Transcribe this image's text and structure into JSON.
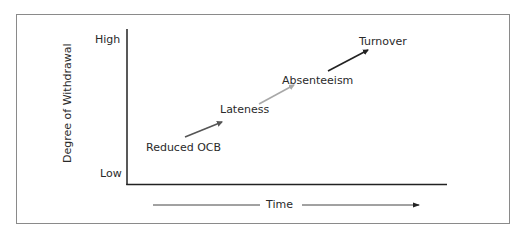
{
  "diagram": {
    "type": "progression-model",
    "y_axis": {
      "label": "Degree of Withdrawal",
      "high_label": "High",
      "low_label": "Low"
    },
    "x_axis": {
      "label": "Time"
    },
    "stages": [
      {
        "label": "Reduced OCB"
      },
      {
        "label": "Lateness"
      },
      {
        "label": "Absenteeism"
      },
      {
        "label": "Turnover"
      }
    ],
    "arrows": [
      {
        "from": "Reduced OCB",
        "to": "Lateness",
        "color": "#555555"
      },
      {
        "from": "Lateness",
        "to": "Absenteeism",
        "color": "#a8a8a8"
      },
      {
        "from": "Absenteeism",
        "to": "Turnover",
        "color": "#222222"
      }
    ],
    "colors": {
      "frame": "#8a8a8a",
      "axis": "#222222",
      "text": "#2a2a2a"
    }
  }
}
